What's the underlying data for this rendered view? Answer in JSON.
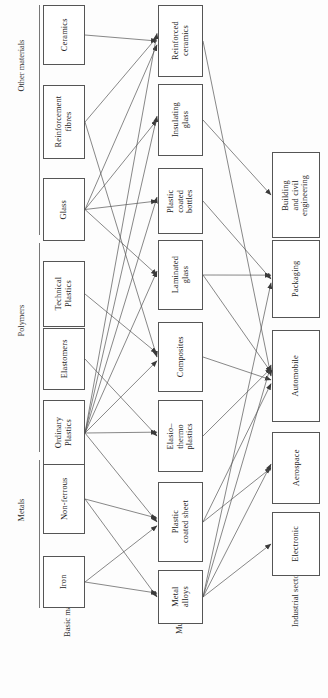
{
  "diagram": {
    "orientation": "rotated-90-ccw",
    "column_labels": [
      {
        "id": "basic-materials",
        "text": "Basic materials"
      },
      {
        "id": "multimaterials",
        "text": "Multimaterials"
      },
      {
        "id": "industrial-sectors",
        "text": "Industrial sectors"
      }
    ],
    "group_labels": [
      {
        "id": "other-materials",
        "text": "Other materials"
      },
      {
        "id": "polymers",
        "text": "Polymers"
      },
      {
        "id": "metals",
        "text": "Metals"
      }
    ],
    "columns": {
      "basic_materials": [
        {
          "id": "ceramics",
          "text": "Ceramics",
          "group": "other-materials"
        },
        {
          "id": "reinforcement-fibres",
          "text": "Reinforcement\nfibres",
          "group": "other-materials"
        },
        {
          "id": "glass",
          "text": "Glass",
          "group": "other-materials"
        },
        {
          "id": "technical-plastics",
          "text": "Technical\nPlastics",
          "group": "polymers"
        },
        {
          "id": "elastomers",
          "text": "Elastomers",
          "group": "polymers"
        },
        {
          "id": "ordinary-plastics",
          "text": "Ordinary\nPlastics",
          "group": "polymers"
        },
        {
          "id": "non-ferrous",
          "text": "Non-ferrous",
          "group": "metals"
        },
        {
          "id": "iron",
          "text": "Iron",
          "group": "metals"
        }
      ],
      "multimaterials": [
        {
          "id": "reinforced-ceramics",
          "text": "Reinforced\nceramics"
        },
        {
          "id": "insulating-glass",
          "text": "Insulating\nglass"
        },
        {
          "id": "plastic-coated-bottles",
          "text": "Plastic\ncoated\nbottles"
        },
        {
          "id": "laminated-glass",
          "text": "Laminated\nglass"
        },
        {
          "id": "composites",
          "text": "Composites"
        },
        {
          "id": "elasto-thermo-plastics",
          "text": "Elasio–\nthermo\nplastics"
        },
        {
          "id": "plastic-coated-sheet",
          "text": "Plastic\ncoated sheet"
        },
        {
          "id": "metal-alloys",
          "text": "Metal\nalloys"
        }
      ],
      "industrial_sectors": [
        {
          "id": "building-civil-engineering",
          "text": "Building\nand civil\nengineering"
        },
        {
          "id": "packaging",
          "text": "Packaging"
        },
        {
          "id": "automobile",
          "text": "Automobile"
        },
        {
          "id": "aerospace",
          "text": "Aerospace"
        },
        {
          "id": "electronic",
          "text": "Electronic"
        }
      ]
    },
    "edges": [
      {
        "from": "ceramics",
        "to": "reinforced-ceramics"
      },
      {
        "from": "reinforcement-fibres",
        "to": "reinforced-ceramics"
      },
      {
        "from": "reinforcement-fibres",
        "to": "composites"
      },
      {
        "from": "glass",
        "to": "insulating-glass"
      },
      {
        "from": "glass",
        "to": "plastic-coated-bottles"
      },
      {
        "from": "glass",
        "to": "laminated-glass"
      },
      {
        "from": "glass",
        "to": "reinforced-ceramics"
      },
      {
        "from": "technical-plastics",
        "to": "composites"
      },
      {
        "from": "elastomers",
        "to": "elasto-thermo-plastics"
      },
      {
        "from": "ordinary-plastics",
        "to": "reinforced-ceramics"
      },
      {
        "from": "ordinary-plastics",
        "to": "insulating-glass"
      },
      {
        "from": "ordinary-plastics",
        "to": "plastic-coated-bottles"
      },
      {
        "from": "ordinary-plastics",
        "to": "laminated-glass"
      },
      {
        "from": "ordinary-plastics",
        "to": "composites"
      },
      {
        "from": "ordinary-plastics",
        "to": "elasto-thermo-plastics"
      },
      {
        "from": "ordinary-plastics",
        "to": "plastic-coated-sheet"
      },
      {
        "from": "non-ferrous",
        "to": "plastic-coated-sheet"
      },
      {
        "from": "non-ferrous",
        "to": "metal-alloys"
      },
      {
        "from": "iron",
        "to": "metal-alloys"
      },
      {
        "from": "iron",
        "to": "plastic-coated-sheet"
      },
      {
        "from": "reinforced-ceramics",
        "to": "automobile"
      },
      {
        "from": "insulating-glass",
        "to": "building-civil-engineering"
      },
      {
        "from": "plastic-coated-bottles",
        "to": "packaging"
      },
      {
        "from": "laminated-glass",
        "to": "packaging"
      },
      {
        "from": "laminated-glass",
        "to": "automobile"
      },
      {
        "from": "composites",
        "to": "automobile"
      },
      {
        "from": "elasto-thermo-plastics",
        "to": "automobile"
      },
      {
        "from": "plastic-coated-sheet",
        "to": "automobile"
      },
      {
        "from": "plastic-coated-sheet",
        "to": "aerospace"
      },
      {
        "from": "metal-alloys",
        "to": "automobile"
      },
      {
        "from": "metal-alloys",
        "to": "aerospace"
      },
      {
        "from": "metal-alloys",
        "to": "electronic"
      },
      {
        "from": "metal-alloys",
        "to": "packaging"
      }
    ],
    "colors": {
      "line": "#555555",
      "box_border": "#555555",
      "text": "#222222",
      "background": "#ffffff"
    }
  }
}
